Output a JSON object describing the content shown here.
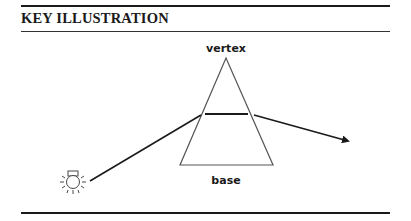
{
  "header": {
    "title": "KEY ILLUSTRATION"
  },
  "diagram": {
    "labels": {
      "vertex": "vertex",
      "base": "base"
    },
    "elements": [
      "light-source",
      "incident-ray",
      "prism",
      "refracted-ray-inside",
      "emergent-ray-arrow"
    ],
    "colors": {
      "ink": "#1a1a1a",
      "prism_outline": "#555555"
    }
  }
}
